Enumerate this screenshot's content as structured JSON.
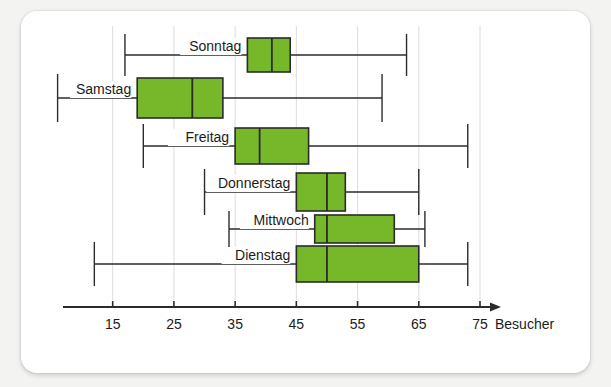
{
  "chart_data": {
    "type": "box",
    "title": "",
    "xlabel": "Besucher",
    "ylabel": "",
    "xlim": [
      5,
      78
    ],
    "xticks": [
      15,
      25,
      35,
      45,
      55,
      65,
      75
    ],
    "xtick_labels": [
      "15",
      "25",
      "35",
      "45",
      "55",
      "65",
      "75"
    ],
    "grid": "vertical gridlines at each x tick",
    "legend": "none",
    "orientation": "horizontal",
    "categories": [
      "Sonntag",
      "Samstag",
      "Freitag",
      "Donnerstag",
      "Mittwoch",
      "Dienstag"
    ],
    "boxes": [
      {
        "label": "Sonntag",
        "min": 17,
        "q1": 37,
        "median": 41,
        "q3": 44,
        "max": 63
      },
      {
        "label": "Samstag",
        "min": 6,
        "q1": 19,
        "median": 28,
        "q3": 33,
        "max": 59
      },
      {
        "label": "Freitag",
        "min": 20,
        "q1": 35,
        "median": 39,
        "q3": 47,
        "max": 73
      },
      {
        "label": "Donnerstag",
        "min": 30,
        "q1": 45,
        "median": 50,
        "q3": 53,
        "max": 65
      },
      {
        "label": "Mittwoch",
        "min": 34,
        "q1": 48,
        "median": 50,
        "q3": 61,
        "max": 66
      },
      {
        "label": "Dienstag",
        "min": 12,
        "q1": 45,
        "median": 50,
        "q3": 65,
        "max": 73
      }
    ],
    "colors": {
      "box_fill": "#76b82a",
      "box_stroke": "#2b2b2b",
      "axis": "#2b2b2b",
      "grid": "#dcdcdc",
      "text": "#1b1b1b",
      "card": "#ffffff",
      "background": "#f3f3f1"
    }
  },
  "axis": {
    "arrow": "right-arrow-icon",
    "unit_label": "Besucher"
  }
}
